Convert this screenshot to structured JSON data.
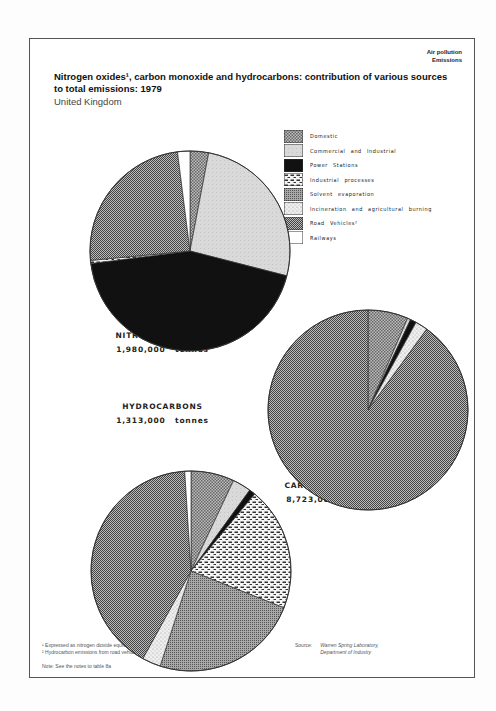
{
  "header": {
    "section_line1": "Air pollution",
    "section_line2": "Emissions",
    "title": "Nitrogen oxides¹, carbon monoxide and hydrocarbons: contribution of various sources to total emissions: 1979",
    "subtitle": "United Kingdom"
  },
  "legend": [
    {
      "label": "Domestic",
      "pattern": "domestic"
    },
    {
      "label": "Commercial and Industrial",
      "pattern": "commercial"
    },
    {
      "label": "Power Stations",
      "pattern": "power"
    },
    {
      "label": "Industrial processes",
      "pattern": "indproc"
    },
    {
      "label": "Solvent evaporation",
      "pattern": "solvent"
    },
    {
      "label": "Incineration and agricultural burning",
      "pattern": "incin"
    },
    {
      "label": "Road Vehicles²",
      "pattern": "road"
    },
    {
      "label": "Railways",
      "pattern": "rail"
    }
  ],
  "labels": {
    "nox_name": "NITROGEN OXIDES¹",
    "nox_total": "1,980,000 tonnes",
    "co_name": "CARBON MONOXIDE",
    "co_total": "8,723,000 tonnes",
    "hc_name": "HYDROCARBONS",
    "hc_total": "1,313,000 tonnes"
  },
  "footer": {
    "footnote1": "¹  Expressed as nitrogen dioxide equivalent",
    "footnote2": "²  Hydrocarbon emissions from road vehicles include mobile evaporative emissions",
    "note": "Note:  See the notes to table 8a",
    "source_label": "Source:",
    "source_line1": "Warren Spring Laboratory,",
    "source_line2": "Department of Industry"
  },
  "chart_data": [
    {
      "type": "pie",
      "title": "NITROGEN OXIDES",
      "total": "1,980,000 tonnes",
      "categories": [
        "Domestic",
        "Commercial and Industrial",
        "Power Stations",
        "Industrial processes",
        "Road Vehicles",
        "Railways"
      ],
      "values": [
        3,
        26,
        44,
        0.5,
        24.5,
        2
      ],
      "unit": "% (estimated)",
      "center": [
        190,
        251
      ],
      "radius": 100
    },
    {
      "type": "pie",
      "title": "CARBON MONOXIDE",
      "total": "8,723,000 tonnes",
      "categories": [
        "Domestic",
        "Commercial and Industrial",
        "Power Stations",
        "Incineration and agricultural burning",
        "Road Vehicles"
      ],
      "values": [
        6.5,
        0.5,
        1,
        2,
        90
      ],
      "unit": "% (estimated)",
      "center": [
        368,
        410
      ],
      "radius": 100
    },
    {
      "type": "pie",
      "title": "HYDROCARBONS",
      "total": "1,313,000 tonnes",
      "categories": [
        "Domestic",
        "Commercial and Industrial",
        "Power Stations",
        "Industrial processes",
        "Solvent evaporation",
        "Incineration and agricultural burning",
        "Road Vehicles",
        "Railways"
      ],
      "values": [
        7,
        3,
        1,
        20,
        24,
        3,
        41,
        1
      ],
      "unit": "% (estimated)",
      "center": [
        191,
        571
      ],
      "radius": 100
    }
  ]
}
